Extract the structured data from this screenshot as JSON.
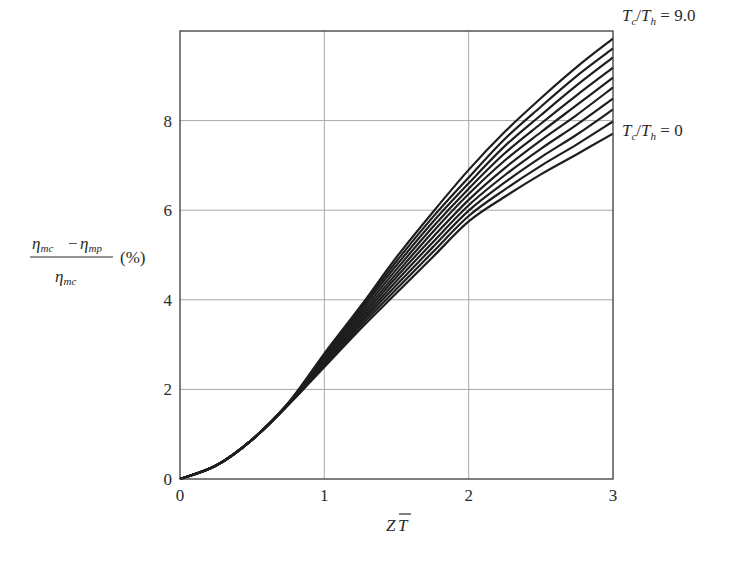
{
  "chart_data": {
    "type": "line",
    "title": "",
    "xlabel": "ZT̅",
    "xlabel_parts": {
      "main": "Z",
      "overbar": "T"
    },
    "ylabel": "(ηmc − ηmp) / ηmc (%)",
    "ylabel_parts": {
      "numerator_left": "η",
      "numerator_left_sub": "mc",
      "minus": "−",
      "numerator_right": "η",
      "numerator_right_sub": "mp",
      "denominator": "η",
      "denominator_sub": "mc",
      "unit": "(%)"
    },
    "xlim": [
      0,
      3
    ],
    "ylim": [
      0,
      10
    ],
    "x_ticks": [
      0,
      1,
      2,
      3
    ],
    "y_ticks": [
      0,
      2,
      4,
      6,
      8
    ],
    "grid": true,
    "legend": "none",
    "annotations": [
      {
        "text": "T_c/T_h = 9.0",
        "parts": {
          "a": "T",
          "a_sub": "c",
          "b": "T",
          "b_sub": "h",
          "eq": "= 9.0"
        },
        "anchor": "top curve right end"
      },
      {
        "text": "T_c/T_h = 0",
        "parts": {
          "a": "T",
          "a_sub": "c",
          "b": "T",
          "b_sub": "h",
          "eq": "= 0"
        },
        "anchor": "bottom curve right end"
      }
    ],
    "x": [
      0,
      0.25,
      0.5,
      0.75,
      1.0,
      1.25,
      1.5,
      1.75,
      2.0,
      2.25,
      2.5,
      2.75,
      3.0
    ],
    "series": [
      {
        "name": "Tc/Th = 0",
        "values": [
          0,
          0.3,
          0.88,
          1.65,
          2.5,
          3.35,
          4.15,
          4.95,
          5.75,
          6.3,
          6.8,
          7.25,
          7.71
        ]
      },
      {
        "name": "curve 2",
        "values": [
          0,
          0.3,
          0.88,
          1.66,
          2.53,
          3.41,
          4.24,
          5.06,
          5.87,
          6.46,
          6.99,
          7.47,
          7.98
        ]
      },
      {
        "name": "curve 3",
        "values": [
          0,
          0.3,
          0.88,
          1.66,
          2.57,
          3.47,
          4.33,
          5.17,
          5.99,
          6.62,
          7.18,
          7.69,
          8.25
        ]
      },
      {
        "name": "curve 4",
        "values": [
          0,
          0.3,
          0.88,
          1.67,
          2.6,
          3.52,
          4.42,
          5.28,
          6.11,
          6.78,
          7.37,
          7.91,
          8.49
        ]
      },
      {
        "name": "curve 5",
        "values": [
          0,
          0.3,
          0.88,
          1.67,
          2.63,
          3.58,
          4.51,
          5.39,
          6.23,
          6.94,
          7.56,
          8.13,
          8.74
        ]
      },
      {
        "name": "curve 6",
        "values": [
          0,
          0.3,
          0.88,
          1.68,
          2.67,
          3.64,
          4.59,
          5.51,
          6.36,
          7.11,
          7.74,
          8.35,
          8.96
        ]
      },
      {
        "name": "curve 7",
        "values": [
          0,
          0.3,
          0.88,
          1.68,
          2.7,
          3.7,
          4.68,
          5.62,
          6.48,
          7.27,
          7.93,
          8.57,
          9.18
        ]
      },
      {
        "name": "curve 8",
        "values": [
          0,
          0.3,
          0.88,
          1.69,
          2.73,
          3.76,
          4.77,
          5.73,
          6.6,
          7.43,
          8.12,
          8.79,
          9.41
        ]
      },
      {
        "name": "curve 9",
        "values": [
          0,
          0.3,
          0.88,
          1.69,
          2.77,
          3.81,
          4.86,
          5.84,
          6.73,
          7.59,
          8.31,
          9.0,
          9.61
        ]
      },
      {
        "name": "Tc/Th = 9.0",
        "values": [
          0,
          0.3,
          0.88,
          1.7,
          2.8,
          3.85,
          4.95,
          5.95,
          6.9,
          7.75,
          8.5,
          9.2,
          9.83
        ]
      }
    ],
    "colors": {
      "line": "#1e1e1e",
      "grid": "#a8a8a8",
      "frame": "#3a3a3a"
    }
  }
}
